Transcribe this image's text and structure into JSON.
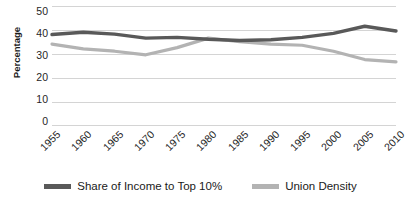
{
  "chart_data": {
    "type": "line",
    "title": "",
    "xlabel": "",
    "ylabel": "Percentage",
    "categories": [
      "1955",
      "1960",
      "1965",
      "1970",
      "1975",
      "1980",
      "1985",
      "1990",
      "1995",
      "2000",
      "2005",
      "2010"
    ],
    "ylim": [
      0,
      50
    ],
    "yticks": [
      0,
      10,
      20,
      30,
      40,
      50
    ],
    "grid": true,
    "legend_position": "bottom",
    "series": [
      {
        "name": "Share of Income to Top 10%",
        "color": "#595959",
        "values": [
          38.0,
          39.0,
          38.2,
          36.5,
          36.8,
          36.0,
          35.5,
          35.8,
          36.8,
          38.5,
          41.5,
          39.5
        ]
      },
      {
        "name": "Union Density",
        "color": "#b3b3b3",
        "values": [
          34.0,
          32.0,
          31.0,
          29.5,
          32.5,
          36.5,
          35.0,
          34.0,
          33.5,
          31.0,
          27.5,
          26.5
        ]
      }
    ]
  },
  "axis": {
    "y_title": "Percentage",
    "y_tick_labels": [
      "50",
      "40",
      "30",
      "20",
      "10",
      "0"
    ],
    "x_tick_labels": [
      "1955",
      "1960",
      "1965",
      "1970",
      "1975",
      "1980",
      "1985",
      "1990",
      "1995",
      "2000",
      "2005",
      "2010"
    ]
  },
  "legend": {
    "entries": [
      {
        "label": "Share of Income to Top 10%",
        "color": "#595959"
      },
      {
        "label": "Union Density",
        "color": "#b3b3b3"
      }
    ]
  },
  "colors": {
    "series_dark": "#595959",
    "series_light": "#b3b3b3",
    "gridline": "#d4d4d4",
    "text": "#1a1a1a",
    "background": "#ffffff"
  }
}
